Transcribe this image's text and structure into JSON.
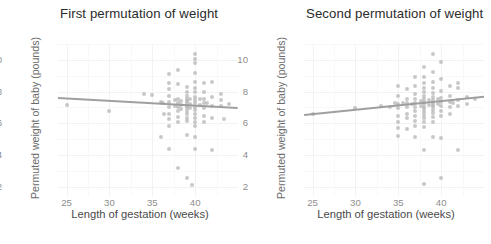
{
  "figure": {
    "background": "#ffffff",
    "point_color": "#b3b3b3",
    "line_color": "#9a9a9a",
    "grid_color": "#f2f2f2",
    "axis_text_color": "#8d8d8d",
    "title_color": "#2b2b2b"
  },
  "chart_data": [
    {
      "type": "scatter",
      "title": "First permutation of weight",
      "xlabel": "Length of gestation (weeks)",
      "ylabel": "Permuted weight of baby (pounds)",
      "xlim": [
        24,
        45
      ],
      "ylim": [
        1.4,
        11.0
      ],
      "xticks": [
        25,
        30,
        35,
        40
      ],
      "yticks": [
        2,
        4,
        6,
        8,
        10
      ],
      "grid": true,
      "legend": "none",
      "trendline": {
        "x": [
          24,
          45
        ],
        "y": [
          7.68,
          7.05
        ],
        "slope": -0.03,
        "intercept": 8.4
      },
      "points": [
        [
          25.0,
          7.15
        ],
        [
          30.0,
          6.75
        ],
        [
          34.0,
          7.85
        ],
        [
          35.0,
          7.8
        ],
        [
          36.0,
          7.35
        ],
        [
          36.0,
          5.15
        ],
        [
          36.2,
          7.25
        ],
        [
          36.4,
          6.55
        ],
        [
          37.0,
          9.1
        ],
        [
          37.0,
          8.55
        ],
        [
          37.0,
          8.15
        ],
        [
          37.0,
          7.7
        ],
        [
          37.0,
          7.35
        ],
        [
          37.0,
          7.0
        ],
        [
          37.0,
          6.6
        ],
        [
          37.0,
          6.25
        ],
        [
          37.0,
          5.85
        ],
        [
          37.0,
          4.35
        ],
        [
          37.6,
          7.45
        ],
        [
          37.6,
          7.1
        ],
        [
          38.0,
          9.35
        ],
        [
          38.0,
          8.45
        ],
        [
          38.0,
          7.55
        ],
        [
          38.0,
          7.3
        ],
        [
          38.0,
          7.05
        ],
        [
          38.0,
          6.8
        ],
        [
          38.0,
          6.4
        ],
        [
          38.0,
          6.1
        ],
        [
          38.0,
          3.2
        ],
        [
          38.4,
          7.4
        ],
        [
          38.4,
          7.15
        ],
        [
          38.4,
          6.9
        ],
        [
          39.0,
          8.3
        ],
        [
          39.0,
          7.95
        ],
        [
          39.0,
          7.7
        ],
        [
          39.0,
          7.55
        ],
        [
          39.0,
          7.4
        ],
        [
          39.0,
          7.25
        ],
        [
          39.0,
          7.1
        ],
        [
          39.0,
          6.95
        ],
        [
          39.0,
          6.8
        ],
        [
          39.0,
          6.6
        ],
        [
          39.0,
          6.35
        ],
        [
          39.0,
          6.15
        ],
        [
          39.0,
          5.25
        ],
        [
          39.0,
          2.55
        ],
        [
          39.4,
          7.5
        ],
        [
          39.4,
          7.2
        ],
        [
          39.4,
          6.95
        ],
        [
          39.6,
          2.1
        ],
        [
          40.0,
          10.35
        ],
        [
          40.0,
          10.05
        ],
        [
          40.0,
          9.8
        ],
        [
          40.0,
          9.15
        ],
        [
          40.0,
          8.6
        ],
        [
          40.0,
          8.25
        ],
        [
          40.0,
          7.95
        ],
        [
          40.0,
          7.65
        ],
        [
          40.0,
          7.45
        ],
        [
          40.0,
          7.25
        ],
        [
          40.0,
          7.05
        ],
        [
          40.0,
          6.85
        ],
        [
          40.0,
          6.6
        ],
        [
          40.0,
          6.35
        ],
        [
          40.0,
          6.1
        ],
        [
          40.0,
          5.8
        ],
        [
          40.0,
          5.15
        ],
        [
          40.0,
          4.35
        ],
        [
          40.6,
          7.55
        ],
        [
          40.6,
          7.15
        ],
        [
          41.0,
          8.55
        ],
        [
          41.0,
          7.95
        ],
        [
          41.0,
          7.55
        ],
        [
          41.0,
          7.25
        ],
        [
          41.0,
          6.95
        ],
        [
          41.0,
          6.45
        ],
        [
          41.0,
          6.1
        ],
        [
          41.4,
          7.3
        ],
        [
          42.0,
          8.6
        ],
        [
          42.0,
          7.65
        ],
        [
          42.0,
          7.1
        ],
        [
          42.0,
          6.3
        ],
        [
          42.0,
          4.3
        ],
        [
          43.0,
          7.85
        ],
        [
          43.0,
          7.45
        ],
        [
          43.0,
          7.1
        ],
        [
          43.4,
          6.25
        ],
        [
          44.0,
          7.2
        ]
      ]
    },
    {
      "type": "scatter",
      "title": "Second permutation of weight",
      "xlabel": "Length of gestation (weeks)",
      "ylabel": "Permuted weight of baby (pounds)",
      "xlim": [
        24,
        45
      ],
      "ylim": [
        1.4,
        11.0
      ],
      "xticks": [
        25,
        30,
        35,
        40
      ],
      "yticks": [
        2,
        4,
        6,
        8,
        10
      ],
      "grid": true,
      "legend": "none",
      "trendline": {
        "x": [
          24,
          45
        ],
        "y": [
          6.55,
          7.7
        ],
        "slope": 0.055,
        "intercept": 5.23
      },
      "points": [
        [
          25.0,
          6.55
        ],
        [
          30.0,
          6.95
        ],
        [
          33.0,
          7.1
        ],
        [
          34.0,
          7.05
        ],
        [
          34.6,
          7.25
        ],
        [
          35.0,
          8.35
        ],
        [
          35.0,
          7.7
        ],
        [
          35.0,
          7.2
        ],
        [
          35.0,
          6.95
        ],
        [
          35.0,
          6.45
        ],
        [
          35.0,
          6.1
        ],
        [
          35.0,
          5.7
        ],
        [
          35.0,
          5.2
        ],
        [
          35.6,
          7.3
        ],
        [
          36.0,
          8.15
        ],
        [
          36.0,
          7.55
        ],
        [
          36.0,
          7.3
        ],
        [
          36.0,
          7.05
        ],
        [
          36.0,
          6.6
        ],
        [
          36.0,
          6.3
        ],
        [
          36.0,
          5.65
        ],
        [
          36.6,
          7.2
        ],
        [
          37.0,
          8.9
        ],
        [
          37.0,
          8.35
        ],
        [
          37.0,
          7.85
        ],
        [
          37.0,
          7.55
        ],
        [
          37.0,
          7.3
        ],
        [
          37.0,
          7.05
        ],
        [
          37.0,
          6.8
        ],
        [
          37.0,
          6.45
        ],
        [
          37.0,
          6.15
        ],
        [
          37.0,
          5.8
        ],
        [
          37.0,
          5.1
        ],
        [
          37.6,
          7.4
        ],
        [
          37.6,
          7.1
        ],
        [
          38.0,
          9.55
        ],
        [
          38.0,
          8.9
        ],
        [
          38.0,
          8.55
        ],
        [
          38.0,
          8.25
        ],
        [
          38.0,
          7.95
        ],
        [
          38.0,
          7.7
        ],
        [
          38.0,
          7.5
        ],
        [
          38.0,
          7.35
        ],
        [
          38.0,
          7.2
        ],
        [
          38.0,
          7.05
        ],
        [
          38.0,
          6.9
        ],
        [
          38.0,
          6.7
        ],
        [
          38.0,
          6.5
        ],
        [
          38.0,
          6.3
        ],
        [
          38.0,
          6.05
        ],
        [
          38.0,
          5.75
        ],
        [
          38.0,
          4.3
        ],
        [
          38.0,
          2.15
        ],
        [
          38.6,
          7.45
        ],
        [
          38.6,
          7.15
        ],
        [
          39.0,
          10.35
        ],
        [
          39.0,
          9.25
        ],
        [
          39.0,
          8.6
        ],
        [
          39.0,
          8.2
        ],
        [
          39.0,
          7.9
        ],
        [
          39.0,
          7.65
        ],
        [
          39.0,
          7.45
        ],
        [
          39.0,
          7.3
        ],
        [
          39.0,
          7.15
        ],
        [
          39.0,
          7.0
        ],
        [
          39.0,
          6.85
        ],
        [
          39.0,
          6.65
        ],
        [
          39.0,
          6.4
        ],
        [
          39.0,
          6.1
        ],
        [
          39.0,
          5.1
        ],
        [
          39.6,
          7.5
        ],
        [
          39.6,
          7.2
        ],
        [
          40.0,
          9.85
        ],
        [
          40.0,
          8.8
        ],
        [
          40.0,
          8.05
        ],
        [
          40.0,
          7.6
        ],
        [
          40.0,
          7.35
        ],
        [
          40.0,
          7.1
        ],
        [
          40.0,
          6.8
        ],
        [
          40.0,
          6.45
        ],
        [
          40.0,
          5.05
        ],
        [
          40.0,
          2.55
        ],
        [
          41.0,
          8.35
        ],
        [
          41.0,
          7.7
        ],
        [
          41.0,
          7.35
        ],
        [
          41.0,
          7.05
        ],
        [
          41.0,
          6.55
        ],
        [
          41.4,
          7.25
        ],
        [
          42.0,
          8.55
        ],
        [
          42.0,
          8.25
        ],
        [
          42.0,
          7.45
        ],
        [
          42.0,
          7.1
        ],
        [
          42.0,
          4.3
        ],
        [
          43.0,
          7.65
        ],
        [
          43.0,
          7.2
        ],
        [
          44.0,
          7.55
        ]
      ]
    }
  ]
}
